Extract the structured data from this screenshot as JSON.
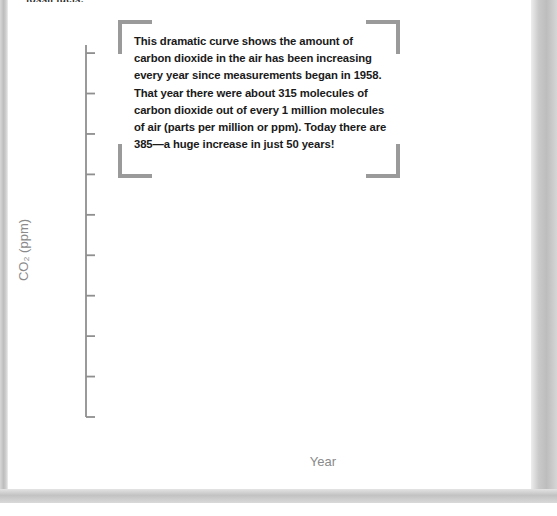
{
  "page": {
    "running_head": "fossil fuels.",
    "background_color": "#ffffff",
    "edge_color": "#c2c2c2"
  },
  "callout": {
    "text": "This dramatic curve shows the amount of carbon dioxide in the air has been increasing every year since measurements began in 1958. That year there were about 315 molecules of carbon dioxide out of every 1 million molecules of air (parts per million or ppm). Today there are 385—a huge increase in just 50 years!",
    "bracket_color": "#9a9a9a"
  },
  "chart_data": {
    "type": "line",
    "title": "",
    "subtitle": "",
    "xlabel": "Year",
    "ylabel": "CO2 (ppm)",
    "ylabel_display": "CO₂ (ppm)",
    "xlim": [
      1955,
      2008
    ],
    "ylim": [
      310,
      402
    ],
    "grid": false,
    "legend": null,
    "axis_color": "#8f8f8f",
    "curve_color": "#6e6e6e",
    "trend_color": "#6b6b6b",
    "x_ticks_major": [
      1955,
      1965,
      1975,
      1985,
      1995,
      2005
    ],
    "x_tick_labels": [
      "1955",
      "1965",
      "1975",
      "1985",
      "1995",
      "2005"
    ],
    "x_tick_minor_step": 1,
    "x_tick_medium_step": 5,
    "y_ticks_major": [
      310,
      320,
      330,
      340,
      350,
      360,
      370,
      380,
      390,
      400
    ],
    "y_tick_labels": [
      "310",
      "320",
      "330",
      "340",
      "350",
      "360",
      "370",
      "380",
      "390",
      "400"
    ],
    "y_tick_minor": [
      315,
      325,
      335,
      345,
      355,
      365,
      375,
      385,
      395
    ],
    "seasonal_amplitude_ppm": 3.1,
    "series": [
      {
        "name": "Monthly mean CO2 (Mauna Loa)",
        "description": "sawtooth seasonal oscillation about the rising trend",
        "x": [
          1958,
          1959,
          1960,
          1961,
          1962,
          1963,
          1964,
          1965,
          1966,
          1967,
          1968,
          1969,
          1970,
          1971,
          1972,
          1973,
          1974,
          1975,
          1976,
          1977,
          1978,
          1979,
          1980,
          1981,
          1982,
          1983,
          1984,
          1985,
          1986,
          1987,
          1988,
          1989,
          1990,
          1991,
          1992,
          1993,
          1994,
          1995,
          1996,
          1997,
          1998,
          1999,
          2000,
          2001,
          2002,
          2003,
          2004,
          2005,
          2006,
          2007
        ],
        "values": [
          315.0,
          315.9,
          316.9,
          317.6,
          318.4,
          319.0,
          319.6,
          320.0,
          321.4,
          322.2,
          323.1,
          324.6,
          325.7,
          326.3,
          327.5,
          329.7,
          330.2,
          331.1,
          332.0,
          333.8,
          335.4,
          336.8,
          338.8,
          340.1,
          341.4,
          343.0,
          344.6,
          346.0,
          347.4,
          349.2,
          351.6,
          353.1,
          354.4,
          355.6,
          356.4,
          357.1,
          358.8,
          360.8,
          362.6,
          363.8,
          366.6,
          368.3,
          369.5,
          371.0,
          373.1,
          375.6,
          377.4,
          379.8,
          381.8,
          383.7
        ]
      }
    ],
    "annotations": [
      {
        "text": "measurements began in 1958",
        "x": 1958,
        "y": 315
      },
      {
        "text": "today 385 ppm",
        "x": 2007,
        "y": 385
      }
    ]
  }
}
